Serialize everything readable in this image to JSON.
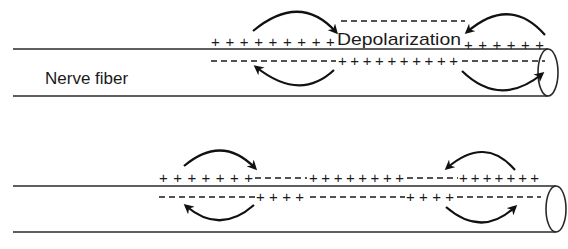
{
  "labels": {
    "fiber": "Nerve fiber",
    "depolarization": "Depolarization"
  },
  "top_fiber": {
    "outer_row": {
      "left_plus": "+++++++++",
      "right_plus": "++++++"
    },
    "inner_row": {
      "left_minus": "−−−−−−−−−−",
      "mid_plus": "++++++++++",
      "right_minus": "−−−−−−"
    }
  },
  "bottom_fiber": {
    "outer_row": {
      "seg1_plus": "+++++++",
      "seg2_minus": "−−−−",
      "seg3_plus": "++++++++",
      "seg4_minus": "−−−−",
      "seg5_plus": "+++++++"
    },
    "inner_row": {
      "seg1_minus": "−−−−−−−",
      "seg2_plus": "++++",
      "seg3_minus": "−−−−−−−−",
      "seg4_plus": "++++",
      "seg5_minus": "−−−−−−"
    }
  },
  "colors": {
    "ink": "#1a1a1a",
    "background": "#ffffff"
  }
}
